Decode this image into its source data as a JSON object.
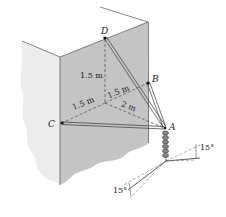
{
  "figure": {
    "type": "statics-diagram",
    "points": {
      "D": "D",
      "B": "B",
      "C": "C",
      "A": "A"
    },
    "dimensions": {
      "vertical_D": "1.5 m",
      "to_C": "1.5 m",
      "to_B": "1.5 m",
      "to_A": "2 m"
    },
    "angles": {
      "upper_right": "15°",
      "lower_left": "15°"
    },
    "colors": {
      "wall_front": "#c4c4c4",
      "wall_side": "#ececec",
      "line": "#333333",
      "background": "#ffffff"
    }
  }
}
